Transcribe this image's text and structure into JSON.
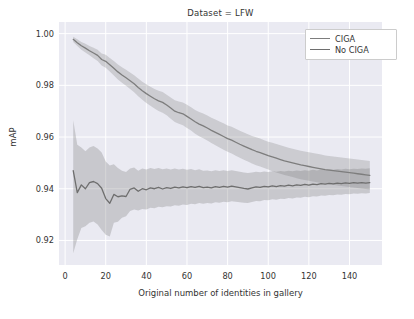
{
  "chart_data": {
    "type": "line",
    "title": "Dataset = LFW",
    "xlabel": "Original number of identities in gallery",
    "ylabel": "mAP",
    "xlim": [
      -3,
      156
    ],
    "ylim": [
      0.9105,
      1.0045
    ],
    "xticks": [
      0,
      20,
      40,
      60,
      80,
      100,
      120,
      140
    ],
    "xticklabels": [
      "0",
      "20",
      "40",
      "60",
      "80",
      "100",
      "120",
      "140"
    ],
    "yticks": [
      0.92,
      0.94,
      0.96,
      0.98,
      1.0
    ],
    "yticklabels": [
      "0.92",
      "0.94",
      "0.96",
      "0.98",
      "1.00"
    ],
    "grid": true,
    "legend_position": "upper right",
    "band_type": "confidence interval (shaded)",
    "x": [
      4,
      6,
      8,
      10,
      12,
      14,
      16,
      18,
      20,
      22,
      24,
      26,
      28,
      30,
      32,
      34,
      36,
      38,
      40,
      42,
      44,
      46,
      48,
      50,
      52,
      54,
      56,
      58,
      60,
      62,
      64,
      66,
      68,
      70,
      72,
      74,
      76,
      78,
      80,
      82,
      84,
      86,
      88,
      90,
      92,
      94,
      96,
      98,
      100,
      102,
      104,
      106,
      108,
      110,
      112,
      114,
      116,
      118,
      120,
      122,
      124,
      126,
      128,
      130,
      132,
      134,
      136,
      138,
      140,
      142,
      144,
      146,
      148,
      150
    ],
    "series": [
      {
        "name": "CIGA",
        "color": "#7d7d7d",
        "values": [
          0.9978,
          0.9965,
          0.9953,
          0.9944,
          0.9934,
          0.9925,
          0.9916,
          0.99,
          0.9893,
          0.988,
          0.9866,
          0.9852,
          0.984,
          0.9829,
          0.9818,
          0.9806,
          0.9792,
          0.9779,
          0.9768,
          0.9758,
          0.9748,
          0.974,
          0.9734,
          0.9724,
          0.9712,
          0.97,
          0.9694,
          0.969,
          0.968,
          0.967,
          0.9659,
          0.965,
          0.9643,
          0.9635,
          0.9626,
          0.9618,
          0.961,
          0.9602,
          0.9594,
          0.9588,
          0.958,
          0.9572,
          0.9565,
          0.9558,
          0.9551,
          0.9545,
          0.954,
          0.9534,
          0.9528,
          0.9523,
          0.9518,
          0.9513,
          0.9508,
          0.9504,
          0.95,
          0.9496,
          0.9492,
          0.9489,
          0.9486,
          0.9483,
          0.948,
          0.9477,
          0.9474,
          0.9472,
          0.947,
          0.9468,
          0.9466,
          0.9464,
          0.9462,
          0.946,
          0.9458,
          0.9456,
          0.9454,
          0.9452
        ],
        "band_lower": [
          0.9968,
          0.9952,
          0.9938,
          0.9927,
          0.9916,
          0.9905,
          0.9894,
          0.9877,
          0.9868,
          0.9854,
          0.9838,
          0.9823,
          0.981,
          0.9798,
          0.9786,
          0.9773,
          0.9758,
          0.9744,
          0.9732,
          0.9721,
          0.971,
          0.9701,
          0.9694,
          0.9684,
          0.9671,
          0.9658,
          0.9651,
          0.9646,
          0.9635,
          0.9625,
          0.9613,
          0.9603,
          0.9595,
          0.9587,
          0.9577,
          0.9568,
          0.956,
          0.9551,
          0.9543,
          0.9536,
          0.9528,
          0.952,
          0.9512,
          0.9505,
          0.9498,
          0.9491,
          0.9486,
          0.948,
          0.9474,
          0.9468,
          0.9463,
          0.9458,
          0.9453,
          0.9449,
          0.9445,
          0.9441,
          0.9437,
          0.9434,
          0.9431,
          0.9428,
          0.9425,
          0.9422,
          0.9419,
          0.9417,
          0.9415,
          0.9413,
          0.9411,
          0.9409,
          0.9407,
          0.9405,
          0.9403,
          0.9401,
          0.9399,
          0.9397
        ],
        "band_upper": [
          0.9988,
          0.9978,
          0.9968,
          0.9961,
          0.9952,
          0.9945,
          0.9938,
          0.9923,
          0.9918,
          0.9906,
          0.9894,
          0.9881,
          0.987,
          0.986,
          0.985,
          0.9839,
          0.9826,
          0.9814,
          0.9804,
          0.9795,
          0.9786,
          0.9779,
          0.9774,
          0.9764,
          0.9753,
          0.9742,
          0.9737,
          0.9734,
          0.9725,
          0.9715,
          0.9705,
          0.9697,
          0.9691,
          0.9683,
          0.9675,
          0.9668,
          0.966,
          0.9653,
          0.9645,
          0.964,
          0.9632,
          0.9624,
          0.9618,
          0.9611,
          0.9604,
          0.9599,
          0.9594,
          0.9588,
          0.9582,
          0.9578,
          0.9573,
          0.9568,
          0.9563,
          0.9559,
          0.9555,
          0.9551,
          0.9547,
          0.9544,
          0.9541,
          0.9538,
          0.9535,
          0.9532,
          0.9529,
          0.9527,
          0.9525,
          0.9523,
          0.9521,
          0.9519,
          0.9517,
          0.9515,
          0.9513,
          0.9511,
          0.9509,
          0.9507
        ]
      },
      {
        "name": "No CIGA",
        "color": "#6e6e6e",
        "values": [
          0.947,
          0.9385,
          0.9415,
          0.94,
          0.9424,
          0.9428,
          0.942,
          0.9402,
          0.9362,
          0.9344,
          0.9378,
          0.9369,
          0.9372,
          0.937,
          0.9398,
          0.9403,
          0.939,
          0.94,
          0.9396,
          0.9403,
          0.94,
          0.9405,
          0.9399,
          0.9404,
          0.9401,
          0.9406,
          0.9403,
          0.9407,
          0.9404,
          0.9408,
          0.9405,
          0.9409,
          0.9404,
          0.9406,
          0.9403,
          0.9408,
          0.9405,
          0.9409,
          0.9406,
          0.941,
          0.9407,
          0.9404,
          0.9401,
          0.9399,
          0.9403,
          0.9407,
          0.9405,
          0.9409,
          0.9407,
          0.9411,
          0.9408,
          0.9412,
          0.941,
          0.9414,
          0.9411,
          0.9415,
          0.9413,
          0.9417,
          0.9414,
          0.9418,
          0.9416,
          0.942,
          0.9418,
          0.9421,
          0.9419,
          0.9422,
          0.942,
          0.9423,
          0.9421,
          0.9424,
          0.9422,
          0.9424,
          0.9422,
          0.9424
        ],
        "band_lower": [
          0.915,
          0.9205,
          0.9248,
          0.9255,
          0.9268,
          0.9273,
          0.9262,
          0.924,
          0.9222,
          0.9215,
          0.9268,
          0.9272,
          0.9288,
          0.9294,
          0.9314,
          0.932,
          0.9316,
          0.9322,
          0.932,
          0.9326,
          0.9325,
          0.933,
          0.9328,
          0.9332,
          0.9331,
          0.9336,
          0.9334,
          0.9339,
          0.9337,
          0.9342,
          0.934,
          0.9345,
          0.9342,
          0.9345,
          0.9343,
          0.9348,
          0.9346,
          0.935,
          0.9348,
          0.9352,
          0.935,
          0.9348,
          0.9346,
          0.9345,
          0.9349,
          0.9353,
          0.9352,
          0.9356,
          0.9355,
          0.9359,
          0.9357,
          0.9361,
          0.936,
          0.9364,
          0.9362,
          0.9366,
          0.9365,
          0.9369,
          0.9367,
          0.9371,
          0.937,
          0.9374,
          0.9373,
          0.9376,
          0.9375,
          0.9378,
          0.9377,
          0.938,
          0.9379,
          0.9382,
          0.9381,
          0.9383,
          0.9382,
          0.9384
        ],
        "band_upper": [
          0.9665,
          0.957,
          0.956,
          0.9545,
          0.956,
          0.9565,
          0.9556,
          0.954,
          0.9505,
          0.949,
          0.9495,
          0.948,
          0.947,
          0.9465,
          0.9478,
          0.9482,
          0.947,
          0.9478,
          0.9474,
          0.948,
          0.9476,
          0.948,
          0.9475,
          0.9478,
          0.9474,
          0.9478,
          0.9474,
          0.9477,
          0.9473,
          0.9476,
          0.9472,
          0.9475,
          0.947,
          0.9471,
          0.9468,
          0.9472,
          0.9469,
          0.9472,
          0.9469,
          0.9472,
          0.9469,
          0.9466,
          0.9463,
          0.9461,
          0.9463,
          0.9466,
          0.9464,
          0.9467,
          0.9465,
          0.9468,
          0.9466,
          0.9469,
          0.9467,
          0.947,
          0.9468,
          0.9471,
          0.9469,
          0.9472,
          0.947,
          0.9473,
          0.9471,
          0.9474,
          0.9472,
          0.9475,
          0.9473,
          0.9476,
          0.9474,
          0.9477,
          0.9475,
          0.9477,
          0.9476,
          0.9478,
          0.9477,
          0.9479
        ]
      }
    ]
  },
  "legend": {
    "items": [
      {
        "label": "CIGA"
      },
      {
        "label": "No CIGA"
      }
    ]
  },
  "style": {
    "axes_background": "#eaeaf2",
    "grid_color": "#ffffff",
    "figure_background": "#ffffff",
    "text_color": "#333333"
  }
}
